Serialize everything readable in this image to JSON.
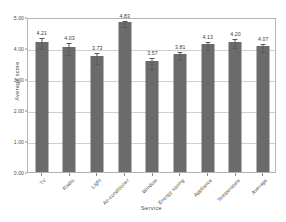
{
  "chart_data": {
    "type": "bar",
    "title": "",
    "xlabel": "Service",
    "ylabel": "Average score",
    "categories": [
      "TV",
      "Radio",
      "Light",
      "Air-conditioner",
      "Window",
      "Energy saving",
      "Appliance",
      "Temperature",
      "Average"
    ],
    "values": [
      4.21,
      4.03,
      3.73,
      4.83,
      3.57,
      3.81,
      4.13,
      4.2,
      4.07
    ],
    "value_labels": [
      "4.21",
      "4.03",
      "3.73",
      "4.83",
      "3.57",
      "3.81",
      "4.13",
      "4.20",
      "4.07"
    ],
    "errors": [
      0.17,
      0.2,
      0.17,
      0.1,
      0.17,
      0.14,
      0.14,
      0.14,
      0.12
    ],
    "ylim": [
      0.0,
      5.0
    ],
    "ytick_values": [
      0.0,
      1.0,
      2.0,
      3.0,
      4.0,
      5.0
    ],
    "ytick_labels": [
      "0.00",
      "1.00",
      "2.00",
      "3.00",
      "4.00",
      "5.00"
    ],
    "grid": "horizontal",
    "legend": "none",
    "error_bars": true,
    "bar_color": "#6b6b6b",
    "grid_color": "#cfcfcf",
    "axis_color": "#b4b4b4",
    "background_color": "#ffffff"
  }
}
